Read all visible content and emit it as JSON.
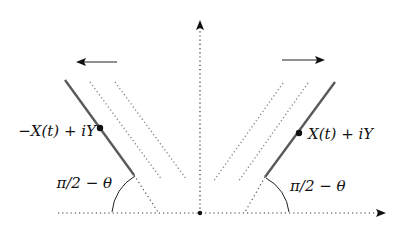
{
  "diagram": {
    "type": "geometric-sketch",
    "axes": {
      "horizontal": {
        "style": "dotted",
        "arrow": "right"
      },
      "vertical": {
        "style": "dotted",
        "arrow": "up"
      },
      "origin_marker": "dot"
    },
    "left_ray": {
      "point_label": "−X(t) + iY",
      "angle_label": "π/2 − θ",
      "motion_arrow": "left",
      "trailing_dotted_copies": 2
    },
    "right_ray": {
      "point_label": "X(t) + iY",
      "angle_label": "π/2 − θ",
      "motion_arrow": "right",
      "trailing_dotted_copies": 2
    },
    "colors": {
      "axis": "#333333",
      "ray": "#5a5a5a",
      "ghost": "#888888",
      "arrow": "#111111",
      "text": "#111111"
    }
  }
}
